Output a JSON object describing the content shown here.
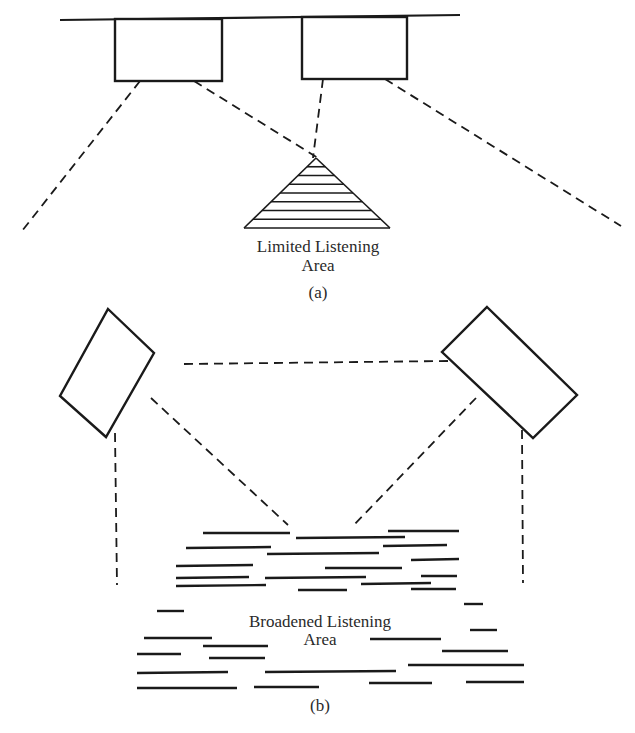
{
  "diagram_a": {
    "caption": "(a)",
    "area_label_line1": "Limited Listening",
    "area_label_line2": "Area",
    "ceiling": {
      "x1": 60,
      "y1": 20,
      "x2": 460,
      "y2": 15
    },
    "speakers": [
      {
        "name": "left-speaker",
        "x": 115,
        "y": 19,
        "w": 107,
        "h": 62
      },
      {
        "name": "right-speaker",
        "x": 302,
        "y": 17,
        "w": 105,
        "h": 62
      }
    ],
    "beams": [
      {
        "x1": 140,
        "y1": 81,
        "x2": 22,
        "y2": 231
      },
      {
        "x1": 194,
        "y1": 81,
        "x2": 318,
        "y2": 158
      },
      {
        "x1": 323,
        "y1": 79,
        "x2": 313,
        "y2": 158
      },
      {
        "x1": 385,
        "y1": 79,
        "x2": 621,
        "y2": 226
      }
    ],
    "listening_triangle": {
      "apex_x": 316,
      "apex_y": 158,
      "base_y": 228,
      "base_left": 244,
      "base_right": 390,
      "hatch_lines": 8
    }
  },
  "diagram_b": {
    "caption": "(b)",
    "area_label_line1": "Broadened Listening",
    "area_label_line2": "Area",
    "speakers": [
      {
        "name": "left-speaker",
        "points": "108,309 154,353 106,437 60,396"
      },
      {
        "name": "right-speaker",
        "points": "487,307 577,395 533,438 442,352"
      }
    ],
    "beams": [
      {
        "x1": 184,
        "y1": 364,
        "x2": 448,
        "y2": 361
      },
      {
        "x1": 115,
        "y1": 433,
        "x2": 117,
        "y2": 585
      },
      {
        "x1": 151,
        "y1": 398,
        "x2": 288,
        "y2": 525
      },
      {
        "x1": 476,
        "y1": 398,
        "x2": 354,
        "y2": 525
      },
      {
        "x1": 522,
        "y1": 430,
        "x2": 523,
        "y2": 583
      }
    ],
    "coverage_bars": [
      [
        203,
        533,
        290,
        533
      ],
      [
        296,
        538,
        405,
        537
      ],
      [
        388,
        531,
        459,
        531
      ],
      [
        186,
        548,
        271,
        547
      ],
      [
        267,
        554,
        379,
        553
      ],
      [
        383,
        546,
        447,
        545
      ],
      [
        176,
        566,
        253,
        565
      ],
      [
        325,
        568,
        402,
        568
      ],
      [
        411,
        560,
        459,
        559
      ],
      [
        176,
        578,
        249,
        577
      ],
      [
        265,
        578,
        366,
        577
      ],
      [
        421,
        576,
        457,
        576
      ],
      [
        176,
        586,
        266,
        585
      ],
      [
        298,
        590,
        347,
        590
      ],
      [
        361,
        584,
        431,
        583
      ],
      [
        411,
        589,
        456,
        589
      ],
      [
        464,
        604,
        483,
        604
      ],
      [
        157,
        611,
        184,
        611
      ],
      [
        144,
        638,
        212,
        638
      ],
      [
        370,
        639,
        441,
        639
      ],
      [
        470,
        630,
        497,
        630
      ],
      [
        203,
        646,
        268,
        646
      ],
      [
        137,
        654,
        181,
        654
      ],
      [
        442,
        651,
        508,
        651
      ],
      [
        209,
        658,
        265,
        658
      ],
      [
        137,
        673,
        228,
        672
      ],
      [
        265,
        672,
        396,
        671
      ],
      [
        408,
        665,
        524,
        665
      ],
      [
        137,
        688,
        237,
        688
      ],
      [
        254,
        687,
        319,
        687
      ],
      [
        369,
        683,
        432,
        683
      ],
      [
        466,
        682,
        524,
        682
      ]
    ]
  }
}
